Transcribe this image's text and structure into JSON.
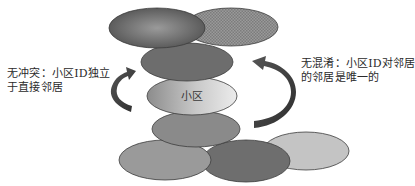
{
  "diagram": {
    "center_cell_label": "小区",
    "left_caption": {
      "lines": [
        "无冲突：小区ID独立",
        "于直接邻居"
      ]
    },
    "right_caption": {
      "lines": [
        "无混淆：小区ID对邻居",
        "的邻居是唯一的"
      ]
    },
    "cells": [
      {
        "id": "top-left",
        "cx": 157,
        "cy": 28,
        "rx": 48,
        "ry": 20,
        "fill": "radial-dark"
      },
      {
        "id": "top-right",
        "cx": 231,
        "cy": 27,
        "rx": 47,
        "ry": 19,
        "fill": "pattern-checker"
      },
      {
        "id": "row2",
        "cx": 187,
        "cy": 62,
        "rx": 46,
        "ry": 19,
        "fill": "#6d6d6d"
      },
      {
        "id": "center",
        "cx": 192,
        "cy": 96,
        "rx": 45,
        "ry": 19,
        "fill": "linear-light"
      },
      {
        "id": "row4",
        "cx": 196,
        "cy": 129,
        "rx": 44,
        "ry": 18,
        "fill": "#8a8a8a"
      },
      {
        "id": "bottom-left",
        "cx": 165,
        "cy": 160,
        "rx": 46,
        "ry": 20,
        "fill": "#9a9a9a"
      },
      {
        "id": "bottom-middle",
        "cx": 246,
        "cy": 161,
        "rx": 44,
        "ry": 21,
        "fill": "#6e6e6e"
      },
      {
        "id": "bottom-right",
        "cx": 306,
        "cy": 151,
        "rx": 43,
        "ry": 19,
        "fill": "#c4c4c4"
      }
    ],
    "colors": {
      "stroke": "#3c3c3c",
      "arrow": "#3a3a3a",
      "text": "#2a2a2a",
      "background": "#ffffff"
    }
  }
}
